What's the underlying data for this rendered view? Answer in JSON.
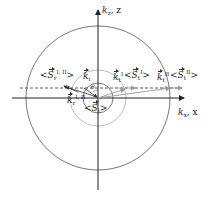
{
  "diagram": {
    "axes": {
      "horizontal_label_k": "k",
      "horizontal_label_sub": "x",
      "horizontal_label_coord": ", x",
      "vertical_label_k": "k",
      "vertical_label_sub": "z",
      "vertical_label_coord": ", z"
    },
    "labels": {
      "S_r": {
        "base": "S",
        "sub": "r",
        "sup": "I, II"
      },
      "k_i": {
        "base": "k",
        "sub": "i"
      },
      "k_tI": {
        "base": "k",
        "sub": "t",
        "sup": "I"
      },
      "S_tI": {
        "base": "S",
        "sub": "t",
        "sup": "I"
      },
      "k_tII": {
        "base": "k",
        "sub": "t",
        "sup": "II"
      },
      "S_tII": {
        "base": "S",
        "sub": "t",
        "sup": "II"
      },
      "k_r": {
        "base": "k",
        "sub": "r",
        "sup": "I, II"
      },
      "S_i": {
        "base": "S",
        "sub": "i"
      },
      "theta_i": "θ"
    },
    "colors": {
      "axis": "#222222",
      "outer_circle": "#555555",
      "middle_circle": "#b5b5b5",
      "inner_circle": "#444444",
      "dashed_line": "#333333",
      "gray_vectors": "#9a9a9a"
    }
  }
}
